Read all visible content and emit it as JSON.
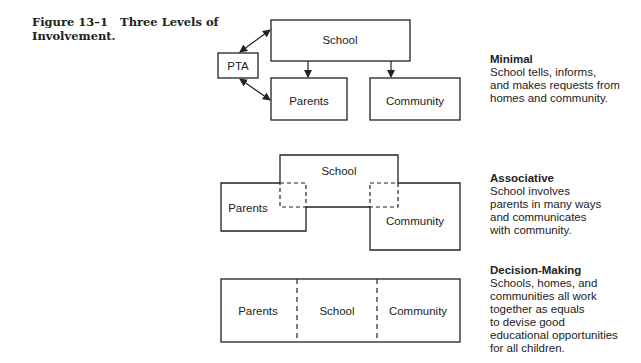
{
  "caption": {
    "number": "Figure 13–1",
    "title": "Three Levels of Involvement."
  },
  "levels": [
    {
      "title": "Minimal",
      "lines": [
        "School tells, informs,",
        "and makes requests from",
        "homes and community."
      ],
      "boxes": {
        "school": "School",
        "pta": "PTA",
        "parents": "Parents",
        "community": "Community"
      }
    },
    {
      "title": "Associative",
      "lines": [
        "School involves",
        "parents in many ways",
        "and communicates",
        "with community."
      ],
      "boxes": {
        "school": "School",
        "parents": "Parents",
        "community": "Community"
      }
    },
    {
      "title": "Decision-Making",
      "lines": [
        "Schools, homes, and",
        "communities all work",
        "together as equals",
        "to devise good",
        "educational opportunities",
        "for all children."
      ],
      "boxes": {
        "parents": "Parents",
        "school": "School",
        "community": "Community"
      }
    }
  ]
}
